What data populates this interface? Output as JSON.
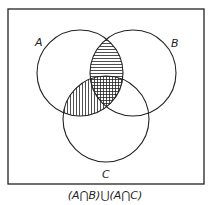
{
  "diagram": {
    "type": "venn",
    "sets": [
      {
        "label": "A",
        "cx": 80,
        "cy": 73,
        "r": 43
      },
      {
        "label": "B",
        "cx": 133,
        "cy": 73,
        "r": 43
      },
      {
        "label": "C",
        "cx": 106,
        "cy": 119,
        "r": 43
      }
    ],
    "shaded_regions": [
      {
        "region": "A∩B",
        "pattern": "horizontal-hatch"
      },
      {
        "region": "A∩C",
        "pattern": "vertical-hatch"
      },
      {
        "region": "A∩B∩C",
        "pattern": "cross-hatch"
      }
    ],
    "caption": "(A⋂B)⋃(A⋂C)"
  },
  "labels": {
    "a": "A",
    "b": "B",
    "c": "C"
  }
}
